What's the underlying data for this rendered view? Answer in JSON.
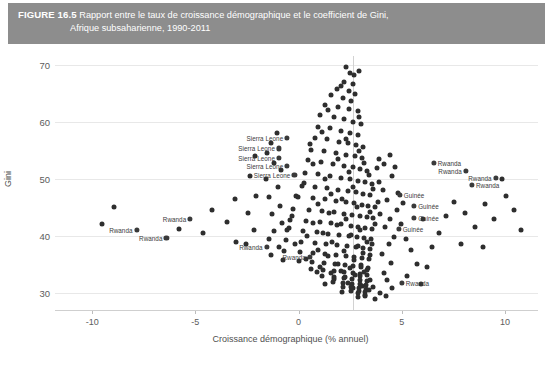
{
  "figure": {
    "number": "FIGURE 16.5",
    "title_line1": "Rapport entre le taux de croissance démographique et le coefficient de Gini,",
    "title_line2": "Afrique subsaharienne, 1990-2011",
    "header_bg": "#8d8d8d",
    "header_text_color": "#ffffff"
  },
  "footnote": "",
  "chart_data": {
    "type": "scatter",
    "title": "Rapport entre le taux de croissance démographique et le coefficient de Gini, Afrique subsaharienne, 1990-2011",
    "xlabel": "Croissance démographique (% annuel)",
    "ylabel": "Gini",
    "xlim": [
      -11.8,
      11.6
    ],
    "ylim": [
      27.0,
      71.5
    ],
    "xticks": [
      -10,
      -5,
      0,
      5,
      10
    ],
    "xticklabels": [
      "-10",
      "-5",
      "0",
      "5",
      "10"
    ],
    "yticks": [
      30,
      40,
      50,
      60,
      70
    ],
    "yticklabels": [
      "30",
      "40",
      "50",
      "60",
      "70"
    ],
    "grid": "horizontal",
    "legend": "none",
    "marker_color": "#2e2e2e",
    "reference_line": {
      "orientation": "vertical",
      "x": 2.66,
      "color": "#d2d2d2"
    },
    "annotations": [
      {
        "text": "Sierra Leone",
        "x": -0.55,
        "y": 57.1,
        "side": "left"
      },
      {
        "text": "Sierra Leone",
        "x": -0.95,
        "y": 55.3,
        "side": "left"
      },
      {
        "text": "Sierra Leone",
        "x": -0.95,
        "y": 53.7,
        "side": "left"
      },
      {
        "text": "Sierra Leone",
        "x": -0.55,
        "y": 52.2,
        "side": "left"
      },
      {
        "text": "Sierra Leone",
        "x": -0.2,
        "y": 50.6,
        "side": "left"
      },
      {
        "text": "Rwanda",
        "x": -5.25,
        "y": 43.0,
        "side": "left"
      },
      {
        "text": "Rwanda",
        "x": -7.85,
        "y": 41.0,
        "side": "left"
      },
      {
        "text": "Rwanda",
        "x": -6.4,
        "y": 39.6,
        "side": "left"
      },
      {
        "text": "Rwanda",
        "x": -1.55,
        "y": 38.0,
        "side": "left"
      },
      {
        "text": "Rwanda",
        "x": 0.55,
        "y": 36.3,
        "side": "left"
      },
      {
        "text": "Rwanda",
        "x": 6.55,
        "y": 52.7,
        "side": "right"
      },
      {
        "text": "Rwanda",
        "x": 8.1,
        "y": 51.4,
        "side": "left"
      },
      {
        "text": "Rwanda",
        "x": 9.55,
        "y": 50.2,
        "side": "left"
      },
      {
        "text": "Rwanda",
        "x": 8.4,
        "y": 48.9,
        "side": "right"
      },
      {
        "text": "Guinée",
        "x": 4.9,
        "y": 47.1,
        "side": "right"
      },
      {
        "text": "Guinée",
        "x": 5.6,
        "y": 45.3,
        "side": "right"
      },
      {
        "text": "Guinée",
        "x": 5.6,
        "y": 43.1,
        "side": "right"
      },
      {
        "text": "Guinée",
        "x": 4.85,
        "y": 41.2,
        "side": "right"
      },
      {
        "text": "Rwanda",
        "x": 5.0,
        "y": 31.7,
        "side": "right"
      }
    ],
    "points": [
      [
        2.32,
        69.5
      ],
      [
        2.95,
        68.8
      ],
      [
        2.7,
        68.2
      ],
      [
        2.22,
        67.0
      ],
      [
        2.62,
        66.6
      ],
      [
        1.88,
        65.8
      ],
      [
        2.42,
        65.3
      ],
      [
        1.58,
        64.6
      ],
      [
        2.15,
        64.1
      ],
      [
        2.55,
        63.7
      ],
      [
        1.3,
        63.0
      ],
      [
        1.92,
        62.6
      ],
      [
        2.45,
        62.2
      ],
      [
        2.86,
        61.8
      ],
      [
        1.05,
        61.2
      ],
      [
        1.7,
        60.8
      ],
      [
        2.2,
        60.4
      ],
      [
        2.62,
        60.0
      ],
      [
        3.02,
        59.6
      ],
      [
        0.92,
        59.1
      ],
      [
        1.52,
        58.8
      ],
      [
        2.05,
        58.4
      ],
      [
        2.48,
        58.0
      ],
      [
        2.88,
        57.7
      ],
      [
        0.78,
        57.2
      ],
      [
        1.38,
        56.9
      ],
      [
        1.98,
        56.5
      ],
      [
        2.4,
        56.2
      ],
      [
        2.8,
        55.9
      ],
      [
        3.12,
        55.5
      ],
      [
        0.62,
        55.1
      ],
      [
        1.22,
        54.8
      ],
      [
        1.82,
        54.5
      ],
      [
        2.3,
        54.2
      ],
      [
        2.72,
        53.9
      ],
      [
        3.05,
        53.6
      ],
      [
        0.45,
        53.2
      ],
      [
        1.1,
        52.9
      ],
      [
        1.68,
        52.6
      ],
      [
        2.18,
        52.3
      ],
      [
        2.62,
        52.0
      ],
      [
        2.98,
        51.7
      ],
      [
        3.3,
        51.4
      ],
      [
        0.3,
        51.0
      ],
      [
        0.95,
        50.8
      ],
      [
        1.52,
        50.5
      ],
      [
        2.05,
        50.2
      ],
      [
        2.5,
        49.9
      ],
      [
        2.88,
        49.6
      ],
      [
        3.22,
        49.4
      ],
      [
        3.55,
        49.1
      ],
      [
        0.15,
        48.8
      ],
      [
        0.82,
        48.6
      ],
      [
        1.4,
        48.3
      ],
      [
        1.92,
        48.1
      ],
      [
        2.38,
        47.8
      ],
      [
        2.78,
        47.6
      ],
      [
        3.12,
        47.3
      ],
      [
        3.48,
        47.1
      ],
      [
        -0.05,
        46.8
      ],
      [
        0.68,
        46.6
      ],
      [
        1.28,
        46.4
      ],
      [
        1.8,
        46.1
      ],
      [
        2.28,
        45.9
      ],
      [
        2.7,
        45.7
      ],
      [
        3.05,
        45.4
      ],
      [
        3.38,
        45.2
      ],
      [
        3.72,
        45.0
      ],
      [
        -0.25,
        44.7
      ],
      [
        0.52,
        44.5
      ],
      [
        1.15,
        44.3
      ],
      [
        1.7,
        44.1
      ],
      [
        2.18,
        43.9
      ],
      [
        2.6,
        43.7
      ],
      [
        2.96,
        43.5
      ],
      [
        3.3,
        43.3
      ],
      [
        3.62,
        43.1
      ],
      [
        -0.4,
        42.8
      ],
      [
        0.38,
        42.6
      ],
      [
        1.02,
        42.4
      ],
      [
        1.58,
        42.2
      ],
      [
        2.08,
        42.0
      ],
      [
        2.52,
        41.8
      ],
      [
        2.9,
        41.6
      ],
      [
        3.24,
        41.4
      ],
      [
        3.56,
        41.2
      ],
      [
        -0.55,
        41.0
      ],
      [
        0.22,
        40.8
      ],
      [
        0.88,
        40.6
      ],
      [
        1.45,
        40.4
      ],
      [
        1.96,
        40.2
      ],
      [
        2.42,
        40.0
      ],
      [
        2.82,
        39.8
      ],
      [
        3.18,
        39.6
      ],
      [
        3.5,
        39.4
      ],
      [
        -0.62,
        39.2
      ],
      [
        0.12,
        39.0
      ],
      [
        0.78,
        38.8
      ],
      [
        1.35,
        38.6
      ],
      [
        1.88,
        38.4
      ],
      [
        2.34,
        38.2
      ],
      [
        2.76,
        38.0
      ],
      [
        3.12,
        37.8
      ],
      [
        3.44,
        37.6
      ],
      [
        -0.7,
        37.4
      ],
      [
        0.05,
        37.2
      ],
      [
        0.7,
        37.0
      ],
      [
        1.28,
        36.8
      ],
      [
        1.82,
        36.6
      ],
      [
        2.28,
        36.5
      ],
      [
        2.7,
        36.3
      ],
      [
        3.08,
        36.1
      ],
      [
        3.4,
        35.9
      ],
      [
        -0.75,
        35.7
      ],
      [
        0.02,
        35.6
      ],
      [
        0.65,
        35.4
      ],
      [
        1.22,
        35.2
      ],
      [
        1.76,
        35.0
      ],
      [
        2.24,
        34.9
      ],
      [
        2.66,
        34.7
      ],
      [
        3.04,
        34.5
      ],
      [
        3.36,
        34.3
      ],
      [
        0.6,
        34.1
      ],
      [
        1.18,
        34.0
      ],
      [
        1.72,
        33.8
      ],
      [
        2.2,
        33.6
      ],
      [
        2.62,
        33.5
      ],
      [
        3.0,
        33.3
      ],
      [
        3.32,
        33.1
      ],
      [
        1.15,
        32.9
      ],
      [
        1.7,
        32.8
      ],
      [
        2.18,
        32.6
      ],
      [
        2.6,
        32.5
      ],
      [
        2.98,
        32.3
      ],
      [
        3.3,
        32.1
      ],
      [
        1.68,
        31.9
      ],
      [
        2.16,
        31.8
      ],
      [
        2.58,
        31.6
      ],
      [
        2.96,
        31.5
      ],
      [
        3.28,
        31.3
      ],
      [
        2.14,
        31.1
      ],
      [
        2.56,
        31.0
      ],
      [
        2.94,
        30.8
      ],
      [
        3.26,
        30.6
      ],
      [
        2.54,
        30.4
      ],
      [
        2.92,
        30.3
      ],
      [
        3.24,
        30.1
      ],
      [
        2.9,
        29.9
      ],
      [
        3.22,
        29.7
      ],
      [
        3.2,
        29.4
      ],
      [
        2.88,
        29.2
      ],
      [
        2.48,
        68.5
      ],
      [
        2.05,
        66.2
      ],
      [
        2.72,
        64.9
      ],
      [
        1.45,
        62.0
      ],
      [
        2.95,
        60.9
      ],
      [
        1.15,
        58.2
      ],
      [
        2.3,
        57.0
      ],
      [
        0.55,
        56.0
      ],
      [
        2.95,
        54.9
      ],
      [
        1.9,
        53.4
      ],
      [
        0.7,
        52.5
      ],
      [
        3.18,
        52.8
      ],
      [
        2.42,
        51.2
      ],
      [
        1.3,
        50.0
      ],
      [
        3.4,
        50.6
      ],
      [
        0.25,
        49.2
      ],
      [
        2.62,
        48.5
      ],
      [
        1.58,
        47.4
      ],
      [
        3.62,
        48.2
      ],
      [
        -0.12,
        47.0
      ],
      [
        2.12,
        46.5
      ],
      [
        0.95,
        45.6
      ],
      [
        3.85,
        46.0
      ],
      [
        2.85,
        45.1
      ],
      [
        1.48,
        44.0
      ],
      [
        -0.32,
        43.5
      ],
      [
        3.48,
        44.2
      ],
      [
        2.32,
        43.0
      ],
      [
        0.72,
        42.3
      ],
      [
        3.95,
        43.8
      ],
      [
        1.88,
        41.9
      ],
      [
        2.98,
        41.0
      ],
      [
        -0.48,
        41.4
      ],
      [
        3.7,
        42.0
      ],
      [
        1.18,
        40.5
      ],
      [
        2.52,
        40.1
      ],
      [
        0.42,
        39.9
      ],
      [
        3.32,
        39.0
      ],
      [
        1.62,
        38.9
      ],
      [
        2.86,
        38.3
      ],
      [
        -0.15,
        38.5
      ],
      [
        3.58,
        38.6
      ],
      [
        0.95,
        37.5
      ],
      [
        2.22,
        37.3
      ],
      [
        3.1,
        36.9
      ],
      [
        1.42,
        36.4
      ],
      [
        2.68,
        35.8
      ],
      [
        0.35,
        35.9
      ],
      [
        3.44,
        36.6
      ],
      [
        1.92,
        35.1
      ],
      [
        2.48,
        34.4
      ],
      [
        3.02,
        34.8
      ],
      [
        1.05,
        34.6
      ],
      [
        2.08,
        33.9
      ],
      [
        3.3,
        34.0
      ],
      [
        1.55,
        33.4
      ],
      [
        2.74,
        33.2
      ],
      [
        0.88,
        33.7
      ],
      [
        3.16,
        33.6
      ],
      [
        2.26,
        32.7
      ],
      [
        1.72,
        32.4
      ],
      [
        2.96,
        32.9
      ],
      [
        3.48,
        32.2
      ],
      [
        2.4,
        31.7
      ],
      [
        1.3,
        31.5
      ],
      [
        3.08,
        31.2
      ],
      [
        2.66,
        30.9
      ],
      [
        3.4,
        30.5
      ],
      [
        2.1,
        30.2
      ],
      [
        3.62,
        31.0
      ],
      [
        4.12,
        33.5
      ],
      [
        4.3,
        32.2
      ],
      [
        4.55,
        30.8
      ],
      [
        3.95,
        30.0
      ],
      [
        4.22,
        29.5
      ],
      [
        3.72,
        29.0
      ],
      [
        4.5,
        35.2
      ],
      [
        4.05,
        36.8
      ],
      [
        4.38,
        38.5
      ],
      [
        4.62,
        39.8
      ],
      [
        4.18,
        41.5
      ],
      [
        4.45,
        43.0
      ],
      [
        4.75,
        44.5
      ],
      [
        4.28,
        46.2
      ],
      [
        4.08,
        48.0
      ],
      [
        3.88,
        49.5
      ],
      [
        4.55,
        50.5
      ],
      [
        4.82,
        47.5
      ],
      [
        5.05,
        45.8
      ],
      [
        4.95,
        42.0
      ],
      [
        5.2,
        39.5
      ],
      [
        3.8,
        51.8
      ],
      [
        4.15,
        52.5
      ],
      [
        3.92,
        53.5
      ],
      [
        4.42,
        54.2
      ],
      [
        4.68,
        52.0
      ],
      [
        -1.05,
        58.0
      ],
      [
        -1.35,
        56.2
      ],
      [
        -1.55,
        54.5
      ],
      [
        -1.2,
        52.8
      ],
      [
        -0.85,
        51.5
      ],
      [
        -1.6,
        50.0
      ],
      [
        -1.02,
        48.5
      ],
      [
        -1.42,
        46.8
      ],
      [
        -0.92,
        45.2
      ],
      [
        -1.28,
        43.8
      ],
      [
        -0.82,
        42.2
      ],
      [
        -1.18,
        40.8
      ],
      [
        -1.45,
        39.5
      ],
      [
        -0.95,
        38.0
      ],
      [
        -1.32,
        36.6
      ],
      [
        -2.1,
        54.0
      ],
      [
        -2.35,
        50.5
      ],
      [
        -2.05,
        47.0
      ],
      [
        -2.45,
        44.0
      ],
      [
        -2.15,
        41.0
      ],
      [
        -2.55,
        38.5
      ],
      [
        -3.1,
        46.5
      ],
      [
        -3.45,
        42.5
      ],
      [
        -3.05,
        39.0
      ],
      [
        -4.2,
        44.5
      ],
      [
        -4.65,
        40.5
      ],
      [
        -5.8,
        41.2
      ],
      [
        -8.95,
        45.0
      ],
      [
        -9.5,
        42.0
      ],
      [
        5.45,
        37.5
      ],
      [
        5.72,
        35.0
      ],
      [
        5.25,
        33.0
      ],
      [
        5.95,
        31.5
      ],
      [
        6.2,
        34.5
      ],
      [
        6.45,
        38.0
      ],
      [
        6.8,
        40.5
      ],
      [
        7.15,
        43.5
      ],
      [
        7.55,
        46.0
      ],
      [
        8.05,
        44.0
      ],
      [
        8.55,
        41.5
      ],
      [
        9.05,
        45.5
      ],
      [
        9.45,
        43.0
      ],
      [
        10.05,
        47.0
      ],
      [
        10.45,
        44.5
      ],
      [
        10.8,
        41.0
      ],
      [
        7.85,
        38.5
      ],
      [
        8.95,
        38.0
      ],
      [
        6.05,
        43.0
      ],
      [
        9.85,
        50.0
      ]
    ]
  }
}
